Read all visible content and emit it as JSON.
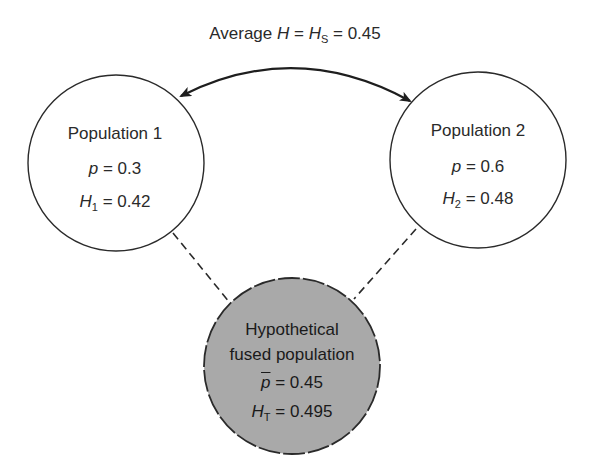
{
  "title": {
    "prefix": "Average ",
    "var": "H",
    "eq1": " = ",
    "var2": "H",
    "var2_sub": "S",
    "eq2": " = 0.45"
  },
  "populations": [
    {
      "name": "Population 1",
      "p_var": "p",
      "p_value": " = 0.3",
      "h_var": "H",
      "h_sub": "1",
      "h_value": " = 0.42"
    },
    {
      "name": "Population 2",
      "p_var": "p",
      "p_value": " = 0.6",
      "h_var": "H",
      "h_sub": "2",
      "h_value": " = 0.48"
    }
  ],
  "fused": {
    "line1": "Hypothetical",
    "line2": "fused population",
    "p_var": "p",
    "p_value": " = 0.45",
    "h_var": "H",
    "h_sub": "T",
    "h_value": " = 0.495"
  },
  "colors": {
    "stroke": "#2a2a2a",
    "fused_fill": "#a9a9a9",
    "background": "#ffffff"
  }
}
